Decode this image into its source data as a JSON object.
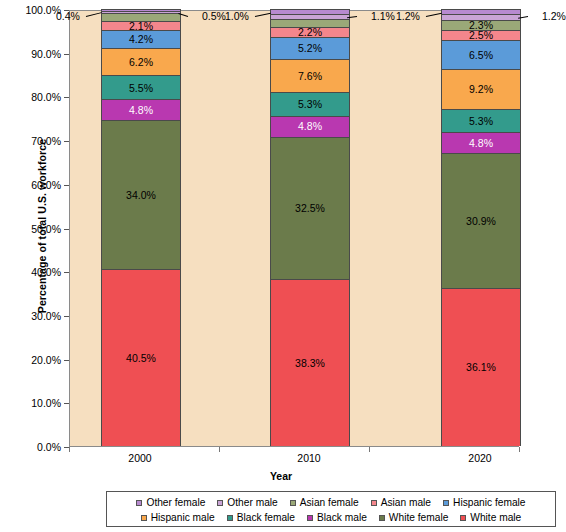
{
  "chart_data": {
    "type": "bar",
    "subtype": "stacked-bar-100-percent",
    "title": "",
    "xlabel": "Year",
    "ylabel": "Percentage of total U.S. workforce",
    "categories": [
      "2000",
      "2010",
      "2020"
    ],
    "ylim": [
      0,
      100
    ],
    "ytick_labels": [
      "0.0%",
      "10.0%",
      "20.0%",
      "30.0%",
      "40.0%",
      "50.0%",
      "60.0%",
      "70.0%",
      "80.0%",
      "90.0%",
      "100.0%"
    ],
    "ytick_values": [
      0,
      10,
      20,
      30,
      40,
      50,
      60,
      70,
      80,
      90,
      100
    ],
    "grid": false,
    "legend_position": "bottom",
    "stack_order_bottom_to_top": [
      "White male",
      "White female",
      "Black male",
      "Black female",
      "Hispanic male",
      "Hispanic female",
      "Asian male",
      "Asian female",
      "Other male",
      "Other female"
    ],
    "series": [
      {
        "name": "White male",
        "color": "#ef4f53",
        "values": [
          40.5,
          38.3,
          36.1
        ],
        "labels": [
          "40.5%",
          "38.3%",
          "36.1%"
        ]
      },
      {
        "name": "White female",
        "color": "#6b7b4b",
        "values": [
          34.0,
          32.5,
          30.9
        ],
        "labels": [
          "34.0%",
          "32.5%",
          "30.9%"
        ]
      },
      {
        "name": "Black male",
        "color": "#b938b0",
        "values": [
          4.8,
          4.8,
          4.8
        ],
        "labels": [
          "4.8%",
          "4.8%",
          "4.8%"
        ]
      },
      {
        "name": "Black female",
        "color": "#339b8c",
        "values": [
          5.5,
          5.3,
          5.3
        ],
        "labels": [
          "5.5%",
          "5.3%",
          "5.3%"
        ]
      },
      {
        "name": "Hispanic male",
        "color": "#f9a84d",
        "values": [
          6.2,
          7.6,
          9.2
        ],
        "labels": [
          "6.2%",
          "7.6%",
          "9.2%"
        ]
      },
      {
        "name": "Hispanic female",
        "color": "#5b9bd9",
        "values": [
          4.2,
          5.2,
          6.5
        ],
        "labels": [
          "4.2%",
          "5.2%",
          "6.5%"
        ]
      },
      {
        "name": "Asian male",
        "color": "#f4868c",
        "values": [
          2.1,
          2.2,
          2.5
        ],
        "labels": [
          "2.1%",
          "2.2%",
          "2.5%"
        ]
      },
      {
        "name": "Asian female",
        "color": "#9aa878",
        "values": [
          1.8,
          1.9,
          2.3
        ],
        "labels": [
          "1.8%",
          "1.9%",
          "2.3%"
        ]
      },
      {
        "name": "Other male",
        "color": "#c9a4d6",
        "values": [
          0.5,
          1.1,
          1.2
        ],
        "labels": [
          "0.5%",
          "1.1%",
          "1.2%"
        ]
      },
      {
        "name": "Other female",
        "color": "#b78ad0",
        "values": [
          0.4,
          1.0,
          1.2
        ],
        "labels": [
          "0.4%",
          "1.0%",
          "1.2%"
        ]
      }
    ],
    "plot_background_color": "#f6dfc0"
  },
  "axes": {
    "y_title": "Percentage of total U.S. workforce",
    "x_title": "Year",
    "y_ticks": [
      {
        "label": "100.0%"
      },
      {
        "label": "90.0%"
      },
      {
        "label": "80.0%"
      },
      {
        "label": "70.0%"
      },
      {
        "label": "60.0%"
      },
      {
        "label": "50.0%"
      },
      {
        "label": "40.0%"
      },
      {
        "label": "30.0%"
      },
      {
        "label": "20.0%"
      },
      {
        "label": "10.0%"
      },
      {
        "label": "0.0%"
      }
    ],
    "x_ticks": [
      {
        "label": "2000"
      },
      {
        "label": "2010"
      },
      {
        "label": "2020"
      }
    ]
  },
  "bars": [
    {
      "year": "2000",
      "segments": [
        {
          "series": "Other female",
          "label": "0.4%",
          "inside": false,
          "side": "left"
        },
        {
          "series": "Other male",
          "label": "0.5%",
          "inside": false,
          "side": "right"
        },
        {
          "series": "Asian female",
          "label": "1.8%",
          "inside": true
        },
        {
          "series": "Asian male",
          "label": "2.1%",
          "inside": true
        },
        {
          "series": "Hispanic female",
          "label": "4.2%",
          "inside": true
        },
        {
          "series": "Hispanic male",
          "label": "6.2%",
          "inside": true
        },
        {
          "series": "Black female",
          "label": "5.5%",
          "inside": true
        },
        {
          "series": "Black male",
          "label": "4.8%",
          "inside": true
        },
        {
          "series": "White female",
          "label": "34.0%",
          "inside": true
        },
        {
          "series": "White male",
          "label": "40.5%",
          "inside": true
        }
      ]
    },
    {
      "year": "2010",
      "segments": [
        {
          "series": "Other female",
          "label": "1.0%",
          "inside": false,
          "side": "left"
        },
        {
          "series": "Other male",
          "label": "1.1%",
          "inside": false,
          "side": "right"
        },
        {
          "series": "Asian female",
          "label": "1.9%",
          "inside": true
        },
        {
          "series": "Asian male",
          "label": "2.2%",
          "inside": true
        },
        {
          "series": "Hispanic female",
          "label": "5.2%",
          "inside": true
        },
        {
          "series": "Hispanic male",
          "label": "7.6%",
          "inside": true
        },
        {
          "series": "Black female",
          "label": "5.3%",
          "inside": true
        },
        {
          "series": "Black male",
          "label": "4.8%",
          "inside": true
        },
        {
          "series": "White female",
          "label": "32.5%",
          "inside": true
        },
        {
          "series": "White male",
          "label": "38.3%",
          "inside": true
        }
      ]
    },
    {
      "year": "2020",
      "segments": [
        {
          "series": "Other female",
          "label": "1.2%",
          "inside": false,
          "side": "left"
        },
        {
          "series": "Other male",
          "label": "1.2%",
          "inside": false,
          "side": "right"
        },
        {
          "series": "Asian female",
          "label": "2.3%",
          "inside": true
        },
        {
          "series": "Asian male",
          "label": "2.5%",
          "inside": true
        },
        {
          "series": "Hispanic female",
          "label": "6.5%",
          "inside": true
        },
        {
          "series": "Hispanic male",
          "label": "9.2%",
          "inside": true
        },
        {
          "series": "Black female",
          "label": "5.3%",
          "inside": true
        },
        {
          "series": "Black male",
          "label": "4.8%",
          "inside": true
        },
        {
          "series": "White female",
          "label": "30.9%",
          "inside": true
        },
        {
          "series": "White male",
          "label": "36.1%",
          "inside": true
        }
      ]
    }
  ],
  "legend": {
    "row1": [
      {
        "label": "Other female",
        "color": "#b78ad0"
      },
      {
        "label": "Other male",
        "color": "#c9a4d6"
      },
      {
        "label": "Asian female",
        "color": "#9aa878"
      },
      {
        "label": "Asian male",
        "color": "#f4868c"
      },
      {
        "label": "Hispanic female",
        "color": "#5b9bd9"
      }
    ],
    "row2": [
      {
        "label": "Hispanic male",
        "color": "#f9a84d"
      },
      {
        "label": "Black female",
        "color": "#339b8c"
      },
      {
        "label": "Black male",
        "color": "#b938b0"
      },
      {
        "label": "White female",
        "color": "#6b7b4b"
      },
      {
        "label": "White male",
        "color": "#ef4f53"
      }
    ]
  }
}
